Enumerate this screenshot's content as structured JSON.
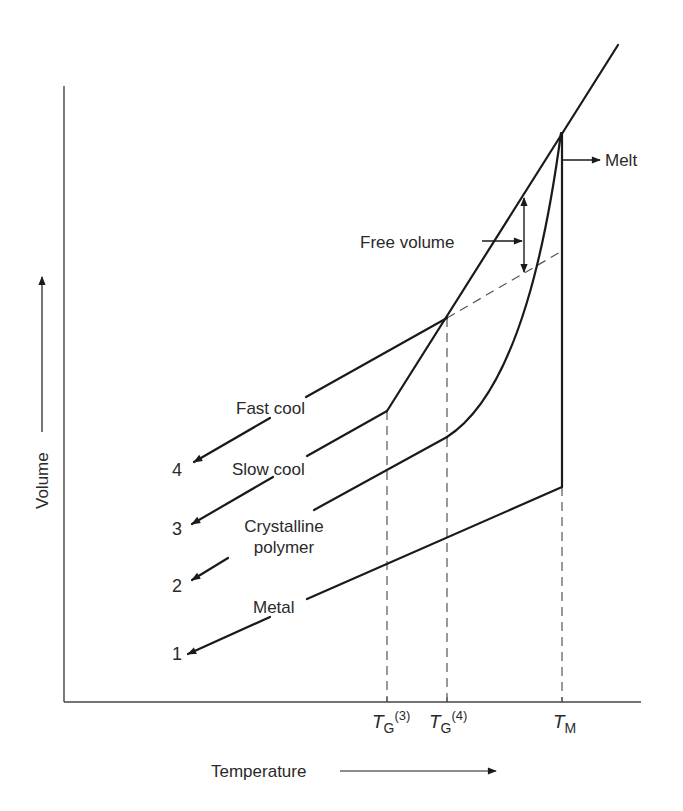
{
  "diagram": {
    "type": "volume-temperature diagram",
    "axes": {
      "x_label": "Temperature",
      "y_label": "Volume",
      "x_ticks": [
        {
          "symbol": "T",
          "subscript": "G",
          "superscript": "(3)"
        },
        {
          "symbol": "T",
          "subscript": "G",
          "superscript": "(4)"
        },
        {
          "symbol": "T",
          "subscript": "M",
          "superscript": ""
        }
      ]
    },
    "annotations": {
      "melt": "Melt",
      "free_volume": "Free volume"
    },
    "curves": [
      {
        "number": "4",
        "label": "Fast cool"
      },
      {
        "number": "3",
        "label": "Slow cool"
      },
      {
        "number": "2",
        "label_line1": "Crystalline",
        "label_line2": "polymer"
      },
      {
        "number": "1",
        "label": "Metal"
      }
    ],
    "colors": {
      "line": "#1a1a1a",
      "dashed": "#555555",
      "text": "#2a2a2a"
    }
  }
}
